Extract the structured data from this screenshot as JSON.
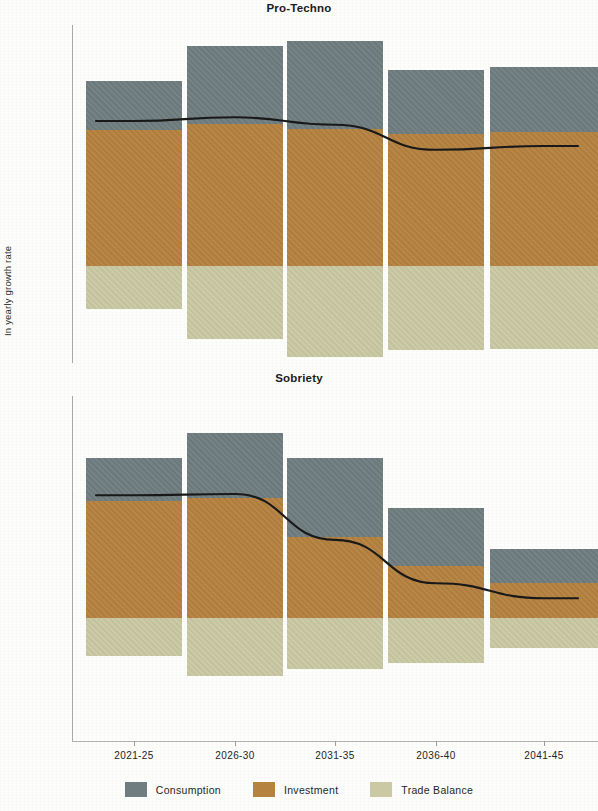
{
  "figure": {
    "ylabel": "In yearly growth rate",
    "panels": [
      {
        "title": "Pro-Techno"
      },
      {
        "title": "Sobriety"
      }
    ],
    "xticklabels": [
      "2021-25",
      "2026-30",
      "2031-35",
      "2036-40",
      "2041-45"
    ],
    "yticklabels": [
      "1.0%",
      "0.0%"
    ]
  },
  "legend": {
    "position": "bottom-center",
    "items": [
      {
        "label": "Consumption",
        "color": "#6f7d80"
      },
      {
        "label": "Investment",
        "color": "#b5823f"
      },
      {
        "label": "Trade Balance",
        "color": "#cac9a3"
      }
    ]
  },
  "chart_data": [
    {
      "type": "bar",
      "subtype": "stacked-bar-with-line-overlay",
      "title": "Pro-Techno",
      "xlabel": "",
      "ylabel": "In yearly growth rate",
      "categories": [
        "2021-25",
        "2026-30",
        "2031-35",
        "2036-40",
        "2041-45"
      ],
      "yticks": [
        0.0,
        1.0
      ],
      "yticklabels": [
        "0.0%",
        "1.0%"
      ],
      "ylim": [
        -0.8,
        1.9
      ],
      "grid": false,
      "series": [
        {
          "name": "Consumption",
          "color": "#6f7d80",
          "values": [
            0.39,
            0.62,
            0.7,
            0.51,
            0.52
          ]
        },
        {
          "name": "Investment",
          "color": "#b5823f",
          "values": [
            1.09,
            1.14,
            1.1,
            1.06,
            1.07
          ]
        },
        {
          "name": "Trade Balance",
          "color": "#cac9a3",
          "values": [
            -0.34,
            -0.58,
            -0.73,
            -0.67,
            -0.66
          ]
        }
      ],
      "line_series": {
        "name": "Total",
        "color": "#191919",
        "values": [
          1.16,
          1.19,
          1.13,
          0.93,
          0.96
        ]
      }
    },
    {
      "type": "bar",
      "subtype": "stacked-bar-with-line-overlay",
      "title": "Sobriety",
      "xlabel": "",
      "ylabel": "In yearly growth rate",
      "categories": [
        "2021-25",
        "2026-30",
        "2031-35",
        "2036-40",
        "2041-45"
      ],
      "yticks": [
        0.0,
        1.0
      ],
      "yticklabels": [
        "0.0%",
        "1.0%"
      ],
      "ylim": [
        -0.8,
        1.9
      ],
      "grid": false,
      "series": [
        {
          "name": "Consumption",
          "color": "#6f7d80",
          "values": [
            0.35,
            0.52,
            0.64,
            0.47,
            0.28
          ]
        },
        {
          "name": "Investment",
          "color": "#b5823f",
          "values": [
            0.94,
            0.97,
            0.65,
            0.42,
            0.28
          ]
        },
        {
          "name": "Trade Balance",
          "color": "#cac9a3",
          "values": [
            -0.31,
            -0.47,
            -0.41,
            -0.36,
            -0.24
          ]
        }
      ],
      "line_series": {
        "name": "Total",
        "color": "#191919",
        "values": [
          0.99,
          1.0,
          0.63,
          0.28,
          0.16
        ]
      }
    }
  ]
}
